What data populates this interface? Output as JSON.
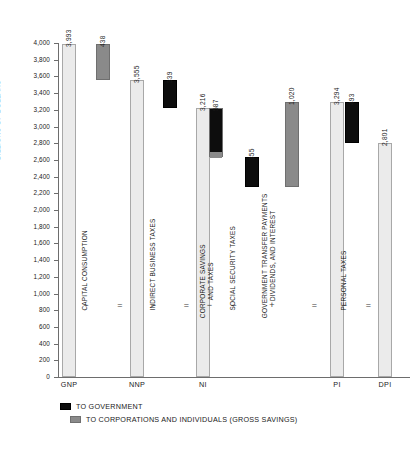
{
  "chart_data": {
    "type": "bar",
    "title": "",
    "xlabel": "",
    "ylabel": "BILLIONS OF DOLLARS",
    "ylim": [
      0,
      4000
    ],
    "ytick_step": 200,
    "grid": false,
    "legend_position": "below-axis-left",
    "categories": [
      "GNP",
      "NNP",
      "NI",
      "PI",
      "DPI"
    ],
    "totals": [
      3993,
      3555,
      3216,
      3294,
      2801
    ],
    "yticks": [
      "0",
      "200",
      "400",
      "600",
      "800",
      "1,000",
      "1,200",
      "1,400",
      "1,600",
      "1,800",
      "2,000",
      "2,200",
      "2,400",
      "2,600",
      "2,800",
      "3,000",
      "3,200",
      "3,400",
      "3,600",
      "3,800",
      "4,000"
    ],
    "bars": [
      {
        "name": "GNP",
        "label": "3,993",
        "value": 3993,
        "bottom": 0,
        "top": 3993,
        "kind": "total"
      },
      {
        "name": "Capital Consumption",
        "label": "438",
        "value": 438,
        "bottom": 3555,
        "top": 3993,
        "kind": "corporations"
      },
      {
        "name": "NNP",
        "label": "3,555",
        "value": 3555,
        "bottom": 0,
        "top": 3555,
        "kind": "total"
      },
      {
        "name": "Indirect Business Taxes",
        "label": "339",
        "value": 339,
        "bottom": 3216,
        "top": 3555,
        "kind": "government"
      },
      {
        "name": "NI",
        "label": "3,216",
        "value": 3216,
        "bottom": 0,
        "top": 3216,
        "kind": "total"
      },
      {
        "name": "Corporate Savings and Taxes",
        "label": "587",
        "value": 587,
        "bottom": 2629,
        "top": 3216,
        "kind": "split",
        "government": 513,
        "corporations": 74
      },
      {
        "name": "Social Security Taxes",
        "label": "355",
        "value": 355,
        "bottom": 2274,
        "top": 2629,
        "kind": "government"
      },
      {
        "name": "Government Transfer Payments, Dividends, and Interest",
        "label": "1,020",
        "value": 1020,
        "bottom": 2274,
        "top": 3294,
        "kind": "corporations"
      },
      {
        "name": "PI",
        "label": "3,294",
        "value": 3294,
        "bottom": 0,
        "top": 3294,
        "kind": "total"
      },
      {
        "name": "Personal Taxes",
        "label": "493",
        "value": 493,
        "bottom": 2801,
        "top": 3294,
        "kind": "government"
      },
      {
        "name": "DPI",
        "label": "2,801",
        "value": 2801,
        "bottom": 0,
        "top": 2801,
        "kind": "total"
      }
    ],
    "steps": [
      {
        "op": "−",
        "label": "CAPITAL CONSUMPTION"
      },
      {
        "op": "="
      },
      {
        "op": "−",
        "label": "INDIRECT BUSINESS TAXES"
      },
      {
        "op": "="
      },
      {
        "op": "−",
        "label": "CORPORATE SAVINGS\nAND TAXES"
      },
      {
        "op": "−",
        "label": "SOCIAL SECURITY TAXES"
      },
      {
        "op": "+",
        "label": "GOVERNMENT TRANSFER PAYMENTS\nDIVIDENDS, AND INTEREST"
      },
      {
        "op": "="
      },
      {
        "op": "−",
        "label": "PERSONAL TAXES"
      },
      {
        "op": "="
      }
    ],
    "legend": [
      {
        "key": "government",
        "label": "TO GOVERNMENT",
        "color": "#0d0d0d"
      },
      {
        "key": "corporations",
        "label": "TO CORPORATIONS AND INDIVIDUALS (GROSS SAVINGS)",
        "color": "#8a8a8a"
      }
    ],
    "colors": {
      "total": "#ebebeb",
      "government": "#0d0d0d",
      "corporations": "#8a8a8a",
      "axis": "#6d6d6d",
      "text": "#1a1a1a",
      "background": "#ffffff"
    }
  }
}
